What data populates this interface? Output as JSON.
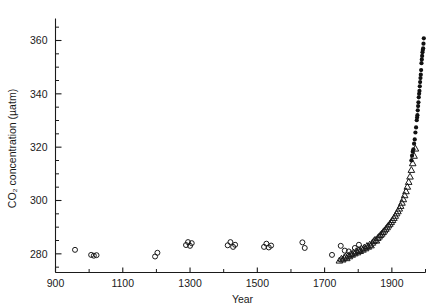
{
  "chart_data": {
    "type": "scatter",
    "title": "",
    "xlabel": "Year",
    "ylabel": "CO2 concentration (µatm)",
    "ylabel_display": "CO₂ concentration (µatm)",
    "xlim": [
      900,
      2000
    ],
    "ylim": [
      273,
      366
    ],
    "grid": false,
    "legend": "none",
    "x_major_ticks": [
      900,
      1100,
      1300,
      1500,
      1700,
      1900
    ],
    "x_major_tick_labels": [
      "900",
      "1100",
      "1300",
      "1500",
      "1700",
      "1900"
    ],
    "x_minor_ticks": [
      1000,
      1200,
      1400,
      1600,
      1800,
      2000
    ],
    "y_major_ticks": [
      280,
      300,
      320,
      340,
      360
    ],
    "y_major_tick_labels": [
      "280",
      "300",
      "320",
      "340",
      "360"
    ],
    "y_minor_ticks": [
      275,
      285,
      290,
      295,
      305,
      310,
      315,
      325,
      330,
      335,
      345,
      350,
      355,
      365
    ],
    "marker_color": "#1a1a1a",
    "series": [
      {
        "name": "ice core (open circles)",
        "marker": "circle-open",
        "points": [
          [
            958,
            281.5
          ],
          [
            1006,
            279.6
          ],
          [
            1014,
            279.3
          ],
          [
            1022,
            279.5
          ],
          [
            1196,
            279.0
          ],
          [
            1203,
            280.4
          ],
          [
            1288,
            283.3
          ],
          [
            1294,
            284.4
          ],
          [
            1300,
            283.0
          ],
          [
            1305,
            284.0
          ],
          [
            1412,
            283.2
          ],
          [
            1420,
            284.4
          ],
          [
            1428,
            282.6
          ],
          [
            1434,
            283.4
          ],
          [
            1520,
            282.6
          ],
          [
            1527,
            283.8
          ],
          [
            1534,
            282.4
          ],
          [
            1541,
            283.1
          ],
          [
            1634,
            284.3
          ],
          [
            1641,
            282.2
          ],
          [
            1722,
            279.6
          ],
          [
            1748,
            283.0
          ],
          [
            1760,
            281.2
          ],
          [
            1772,
            280.9
          ],
          [
            1790,
            282.2
          ],
          [
            1802,
            283.4
          ]
        ]
      },
      {
        "name": "ice core (open triangles)",
        "marker": "triangle-open",
        "points": [
          [
            1744,
            277.5
          ],
          [
            1750,
            278.2
          ],
          [
            1754,
            277.9
          ],
          [
            1758,
            278.6
          ],
          [
            1762,
            279.0
          ],
          [
            1766,
            278.4
          ],
          [
            1770,
            279.4
          ],
          [
            1774,
            279.1
          ],
          [
            1778,
            280.0
          ],
          [
            1782,
            279.7
          ],
          [
            1786,
            280.5
          ],
          [
            1790,
            280.2
          ],
          [
            1794,
            281.0
          ],
          [
            1798,
            280.6
          ],
          [
            1802,
            281.4
          ],
          [
            1806,
            281.1
          ],
          [
            1810,
            282.0
          ],
          [
            1814,
            281.6
          ],
          [
            1818,
            282.4
          ],
          [
            1822,
            282.1
          ],
          [
            1826,
            283.0
          ],
          [
            1830,
            282.7
          ],
          [
            1834,
            283.5
          ],
          [
            1838,
            283.2
          ],
          [
            1842,
            284.2
          ],
          [
            1846,
            284.8
          ],
          [
            1850,
            285.3
          ],
          [
            1854,
            285.0
          ],
          [
            1858,
            286.0
          ],
          [
            1862,
            286.5
          ],
          [
            1866,
            287.1
          ],
          [
            1870,
            287.6
          ],
          [
            1874,
            288.2
          ],
          [
            1878,
            288.8
          ],
          [
            1882,
            289.4
          ],
          [
            1886,
            290.0
          ],
          [
            1890,
            290.7
          ],
          [
            1894,
            291.3
          ],
          [
            1898,
            292.0
          ],
          [
            1902,
            292.7
          ],
          [
            1906,
            293.5
          ],
          [
            1910,
            294.3
          ],
          [
            1914,
            295.2
          ],
          [
            1918,
            296.0
          ],
          [
            1922,
            297.0
          ],
          [
            1926,
            298.0
          ],
          [
            1930,
            299.2
          ],
          [
            1934,
            300.5
          ],
          [
            1938,
            302.0
          ],
          [
            1942,
            303.5
          ],
          [
            1946,
            305.2
          ],
          [
            1950,
            307.0
          ],
          [
            1954,
            309.0
          ],
          [
            1958,
            311.5
          ],
          [
            1962,
            314.0
          ],
          [
            1966,
            316.8
          ],
          [
            1970,
            319.5
          ]
        ]
      },
      {
        "name": "Mauna Loa (filled circles)",
        "marker": "circle-filled",
        "points": [
          [
            1958,
            315.0
          ],
          [
            1960,
            316.8
          ],
          [
            1962,
            318.3
          ],
          [
            1964,
            319.2
          ],
          [
            1966,
            321.3
          ],
          [
            1968,
            322.9
          ],
          [
            1970,
            325.5
          ],
          [
            1972,
            327.4
          ],
          [
            1974,
            330.1
          ],
          [
            1975,
            331.1
          ],
          [
            1976,
            332.0
          ],
          [
            1977,
            333.8
          ],
          [
            1978,
            335.4
          ],
          [
            1979,
            336.8
          ],
          [
            1980,
            338.7
          ],
          [
            1981,
            340.0
          ],
          [
            1982,
            341.1
          ],
          [
            1983,
            342.8
          ],
          [
            1984,
            344.4
          ],
          [
            1985,
            345.9
          ],
          [
            1986,
            347.2
          ],
          [
            1987,
            348.9
          ],
          [
            1988,
            351.5
          ],
          [
            1989,
            352.9
          ],
          [
            1990,
            354.2
          ],
          [
            1991,
            355.6
          ],
          [
            1992,
            356.4
          ],
          [
            1993,
            357.1
          ],
          [
            1994,
            358.8
          ],
          [
            1995,
            360.8
          ]
        ]
      }
    ]
  }
}
